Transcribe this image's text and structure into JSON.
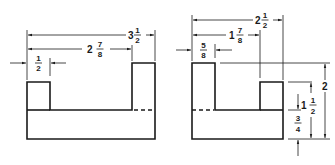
{
  "diagram": {
    "type": "orthographic-dimensioned-drawing",
    "figures": [
      {
        "name": "left-view",
        "dimensions": [
          {
            "label": "3 1/2",
            "whole": "3",
            "num": "1",
            "den": "2",
            "orientation": "horizontal"
          },
          {
            "label": "2 7/8",
            "whole": "2",
            "num": "7",
            "den": "8",
            "orientation": "horizontal"
          },
          {
            "label": "1/2",
            "whole": "",
            "num": "1",
            "den": "2",
            "orientation": "horizontal"
          }
        ]
      },
      {
        "name": "right-view",
        "dimensions": [
          {
            "label": "2 1/2",
            "whole": "2",
            "num": "1",
            "den": "2",
            "orientation": "horizontal"
          },
          {
            "label": "1 7/8",
            "whole": "1",
            "num": "7",
            "den": "8",
            "orientation": "horizontal"
          },
          {
            "label": "5/8",
            "whole": "",
            "num": "5",
            "den": "8",
            "orientation": "horizontal"
          },
          {
            "label": "2",
            "whole": "2",
            "num": "",
            "den": "",
            "orientation": "vertical"
          },
          {
            "label": "1 1/2",
            "whole": "1",
            "num": "1",
            "den": "2",
            "orientation": "vertical"
          },
          {
            "label": "3/4",
            "whole": "",
            "num": "3",
            "den": "4",
            "orientation": "vertical"
          }
        ]
      }
    ],
    "line_color": "#1a1a1a",
    "background": "#ffffff"
  }
}
